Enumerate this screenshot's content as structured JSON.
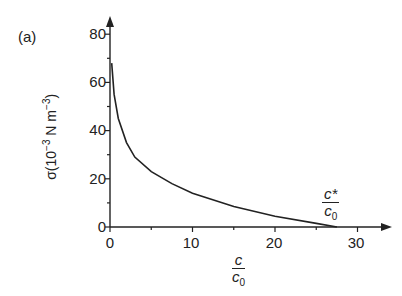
{
  "panel_label": "(a)",
  "chart_data": {
    "type": "line",
    "title": "",
    "xlabel": "c / c0",
    "ylabel": "σ(10^-3 N m^-3)",
    "xlim": [
      0,
      32
    ],
    "ylim": [
      0,
      82
    ],
    "xticks": [
      0,
      10,
      20,
      30
    ],
    "yticks": [
      0,
      20,
      40,
      60,
      80
    ],
    "grid": false,
    "legend": null,
    "annotations": [
      {
        "text": "c*/c0",
        "x": 27.5,
        "y": 0
      }
    ],
    "series": [
      {
        "name": "σ",
        "x": [
          0.2,
          0.5,
          1,
          2,
          3,
          5,
          7.5,
          10,
          15,
          20,
          25,
          27.5
        ],
        "y": [
          68,
          55,
          45,
          35,
          29,
          23,
          18,
          14,
          8.5,
          4.5,
          1.5,
          0
        ]
      }
    ]
  },
  "labels": {
    "ytick_0": "0",
    "ytick_20": "20",
    "ytick_40": "40",
    "ytick_60": "60",
    "ytick_80": "80",
    "xtick_0": "0",
    "xtick_10": "10",
    "xtick_20": "20",
    "xtick_30": "30",
    "ylabel_prefix": "σ(10",
    "ylabel_exp": "−3",
    "ylabel_unit": " N m",
    "ylabel_unit_exp": "−3",
    "ylabel_suffix": ")",
    "xlabel_num": "c",
    "xlabel_den": "c",
    "xlabel_den_sub": "0",
    "annot_num": "c*",
    "annot_den": "c",
    "annot_den_sub": "0"
  }
}
